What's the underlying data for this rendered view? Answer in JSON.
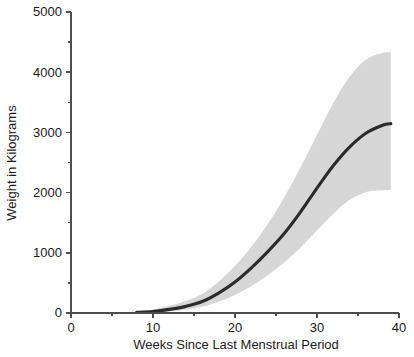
{
  "chart_data": {
    "type": "line",
    "title": "",
    "xlabel": "Weeks Since Last Menstrual Period",
    "ylabel": "Weight in Kilograms",
    "xlim": [
      0,
      40
    ],
    "ylim": [
      0,
      5000
    ],
    "grid": false,
    "legend": null,
    "x_ticks_major": [
      0,
      10,
      20,
      30,
      40
    ],
    "x_tick_labels": [
      "0",
      "10",
      "20",
      "30",
      "40"
    ],
    "x_ticks_minor": [
      5,
      15,
      25,
      35
    ],
    "y_ticks_major": [
      0,
      1000,
      2000,
      3000,
      4000,
      5000
    ],
    "y_tick_labels": [
      "0",
      "1000",
      "2000",
      "3000",
      "4000",
      "5000"
    ],
    "y_ticks_minor": [
      500,
      1500,
      2500,
      3500,
      4500
    ],
    "colors": {
      "curve": "#2b2b2b",
      "band": "#d6d6d6",
      "axis": "#4d4d4d",
      "text": "#1a1a1a",
      "background": "#ffffff"
    },
    "series": [
      {
        "name": "Mean weight",
        "x": [
          8,
          10,
          12,
          14,
          16,
          18,
          20,
          22,
          24,
          26,
          28,
          30,
          32,
          34,
          36,
          38,
          39
        ],
        "values": [
          10,
          25,
          60,
          110,
          190,
          330,
          515,
          750,
          1020,
          1320,
          1680,
          2075,
          2450,
          2760,
          2990,
          3120,
          3145
        ]
      },
      {
        "name": "Upper bound",
        "x": [
          8,
          10,
          12,
          14,
          16,
          18,
          20,
          22,
          24,
          26,
          28,
          30,
          32,
          34,
          36,
          38,
          39
        ],
        "values": [
          30,
          60,
          120,
          200,
          320,
          520,
          780,
          1100,
          1480,
          1920,
          2420,
          2960,
          3490,
          3930,
          4210,
          4320,
          4330
        ]
      },
      {
        "name": "Lower bound",
        "x": [
          8,
          10,
          12,
          14,
          16,
          18,
          20,
          22,
          24,
          26,
          28,
          30,
          32,
          34,
          36,
          38,
          39
        ],
        "values": [
          0,
          5,
          25,
          55,
          105,
          185,
          300,
          450,
          630,
          840,
          1090,
          1370,
          1650,
          1880,
          2010,
          2040,
          2045
        ]
      }
    ]
  },
  "figure": {
    "ylabel_text": "Weight in Kilograms",
    "xlabel_text": "Weeks Since Last Menstrual Period"
  }
}
